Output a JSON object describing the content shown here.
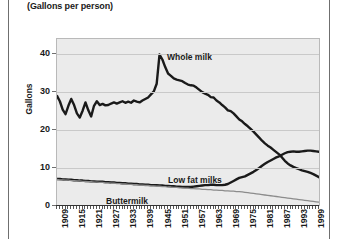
{
  "subtitle": "(Gallons per person)",
  "axes": {
    "ylabel": "Gallons",
    "yticks": [
      0,
      10,
      20,
      30,
      40
    ],
    "ylim": [
      0,
      44
    ],
    "xlim": [
      1909,
      2001
    ],
    "xticks": [
      1909,
      1915,
      1921,
      1927,
      1933,
      1939,
      1945,
      1951,
      1957,
      1963,
      1969,
      1975,
      1981,
      1987,
      1993,
      1999
    ]
  },
  "labels": {
    "whole_milk": "Whole milk",
    "low_fat_milks": "Low fat milks",
    "buttermilk": "Buttermilk"
  },
  "colors": {
    "plot_background": "#ebebeb",
    "gridline": "#c9c9c9",
    "series_dark": "#1a1a1a",
    "series_gray": "#8c8c8c",
    "frame": "#b9b9b9"
  },
  "chart_data": {
    "type": "line",
    "title": "",
    "subtitle": "(Gallons per person)",
    "xlabel": "",
    "ylabel": "Gallons",
    "xlim": [
      1909,
      2001
    ],
    "ylim": [
      0,
      44
    ],
    "grid": true,
    "legend": "inline-annotations",
    "x": [
      1909,
      1910,
      1911,
      1912,
      1913,
      1914,
      1915,
      1916,
      1917,
      1918,
      1919,
      1920,
      1921,
      1922,
      1923,
      1924,
      1925,
      1926,
      1927,
      1928,
      1929,
      1930,
      1931,
      1932,
      1933,
      1934,
      1935,
      1936,
      1937,
      1938,
      1939,
      1940,
      1941,
      1942,
      1943,
      1944,
      1945,
      1946,
      1947,
      1948,
      1949,
      1950,
      1951,
      1952,
      1953,
      1954,
      1955,
      1956,
      1957,
      1958,
      1959,
      1960,
      1961,
      1962,
      1963,
      1964,
      1965,
      1966,
      1967,
      1968,
      1969,
      1970,
      1971,
      1972,
      1973,
      1974,
      1975,
      1976,
      1977,
      1978,
      1979,
      1980,
      1981,
      1982,
      1983,
      1984,
      1985,
      1986,
      1987,
      1988,
      1989,
      1990,
      1991,
      1992,
      1993,
      1994,
      1995,
      1996,
      1997,
      1998,
      1999,
      2000,
      2001
    ],
    "series": [
      {
        "name": "Whole milk",
        "style": "thick-dark",
        "values": [
          29.0,
          27.6,
          25.4,
          24.2,
          26.4,
          28.2,
          26.6,
          24.4,
          23.3,
          25.1,
          27.3,
          25.2,
          23.6,
          26.4,
          27.6,
          26.6,
          26.9,
          26.5,
          26.6,
          27.0,
          27.3,
          27.0,
          27.3,
          27.6,
          27.2,
          27.5,
          27.2,
          27.8,
          27.5,
          27.3,
          27.8,
          28.2,
          28.6,
          29.4,
          30.2,
          32.2,
          39.9,
          38.6,
          36.6,
          34.9,
          34.3,
          33.6,
          33.3,
          33.1,
          32.9,
          32.4,
          32.0,
          31.8,
          31.7,
          31.2,
          30.6,
          30.0,
          29.6,
          29.3,
          28.7,
          28.6,
          27.8,
          27.3,
          26.6,
          26.0,
          25.2,
          25.0,
          24.4,
          23.6,
          22.8,
          22.3,
          21.6,
          21.0,
          20.3,
          19.6,
          18.8,
          18.0,
          17.2,
          16.5,
          15.9,
          15.4,
          14.8,
          14.2,
          13.6,
          12.8,
          11.9,
          11.2,
          10.7,
          10.3,
          10.0,
          9.7,
          9.4,
          9.2,
          9.0,
          8.7,
          8.4,
          8.0,
          7.6
        ]
      },
      {
        "name": "Low fat milks",
        "style": "thick-dark",
        "values": [
          7.1,
          7.1,
          7.0,
          7.0,
          6.9,
          6.9,
          6.8,
          6.8,
          6.7,
          6.7,
          6.6,
          6.6,
          6.5,
          6.5,
          6.4,
          6.4,
          6.4,
          6.3,
          6.3,
          6.2,
          6.2,
          6.1,
          6.1,
          6.0,
          6.0,
          5.9,
          5.9,
          5.8,
          5.8,
          5.7,
          5.7,
          5.6,
          5.6,
          5.5,
          5.5,
          5.5,
          5.4,
          5.4,
          5.3,
          5.3,
          5.2,
          5.2,
          5.1,
          5.1,
          5.0,
          5.0,
          5.0,
          5.0,
          5.1,
          5.2,
          5.3,
          5.4,
          5.5,
          5.5,
          5.6,
          5.6,
          5.5,
          5.5,
          5.5,
          5.6,
          5.8,
          6.2,
          6.6,
          7.0,
          7.4,
          7.6,
          7.8,
          8.2,
          8.6,
          9.0,
          9.5,
          10.0,
          10.6,
          11.1,
          11.6,
          12.0,
          12.4,
          12.8,
          13.1,
          13.5,
          13.9,
          14.2,
          14.3,
          14.4,
          14.3,
          14.3,
          14.4,
          14.5,
          14.6,
          14.6,
          14.5,
          14.4,
          14.3
        ]
      },
      {
        "name": "Buttermilk",
        "style": "thin-gray",
        "values": [
          7.0,
          6.9,
          6.9,
          6.8,
          6.8,
          6.7,
          6.7,
          6.6,
          6.6,
          6.5,
          6.5,
          6.4,
          6.4,
          6.3,
          6.3,
          6.2,
          6.2,
          6.1,
          6.1,
          6.0,
          6.0,
          5.9,
          5.9,
          5.8,
          5.8,
          5.7,
          5.7,
          5.6,
          5.6,
          5.5,
          5.5,
          5.4,
          5.4,
          5.3,
          5.3,
          5.2,
          5.2,
          5.1,
          5.1,
          5.0,
          5.0,
          4.9,
          4.9,
          4.8,
          4.8,
          4.7,
          4.7,
          4.6,
          4.6,
          4.5,
          4.5,
          4.4,
          4.4,
          4.3,
          4.3,
          4.2,
          4.2,
          4.1,
          4.1,
          4.0,
          4.0,
          3.9,
          3.9,
          3.8,
          3.8,
          3.7,
          3.6,
          3.5,
          3.4,
          3.3,
          3.2,
          3.1,
          3.0,
          2.9,
          2.8,
          2.7,
          2.6,
          2.5,
          2.4,
          2.3,
          2.2,
          2.1,
          2.0,
          1.9,
          1.8,
          1.7,
          1.6,
          1.5,
          1.4,
          1.3,
          1.2,
          1.1,
          1.0
        ]
      }
    ]
  }
}
